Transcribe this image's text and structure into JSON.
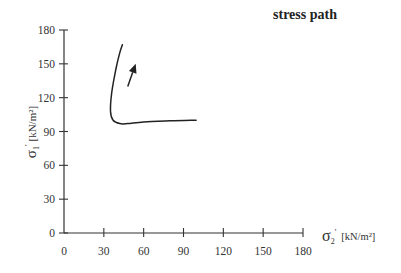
{
  "chart_data": {
    "type": "line",
    "title": "stress path",
    "xlabel": "σ2' [kN/m²]",
    "ylabel": "σ1' [kN/m²]",
    "xlim": [
      0,
      180
    ],
    "ylim": [
      0,
      180
    ],
    "x_ticks": [
      "0",
      "30",
      "60",
      "90",
      "120",
      "150",
      "180"
    ],
    "y_ticks": [
      "0",
      "30",
      "60",
      "90",
      "120",
      "150",
      "180"
    ],
    "grid": false,
    "legend": null,
    "series": [
      {
        "name": "stress path",
        "x": [
          99.5,
          80,
          60,
          48,
          42,
          37,
          35,
          36,
          39,
          42,
          44
        ],
        "y": [
          100,
          99.5,
          98.5,
          97,
          97,
          100,
          108,
          125,
          145,
          160,
          167
        ]
      }
    ],
    "annotations": [
      {
        "type": "arrow",
        "from": [
          48,
          130
        ],
        "to": [
          54,
          150
        ],
        "meaning": "direction of stress path"
      }
    ]
  },
  "labels": {
    "title": "stress path",
    "xlabel_sigma": "σ",
    "xlabel_sub": "2",
    "xlabel_prime": "'",
    "xlabel_unit": "[kN/m²]",
    "ylabel_sigma": "σ",
    "ylabel_sub": "1",
    "ylabel_prime": "'",
    "ylabel_unit": "[kN/m²]"
  }
}
